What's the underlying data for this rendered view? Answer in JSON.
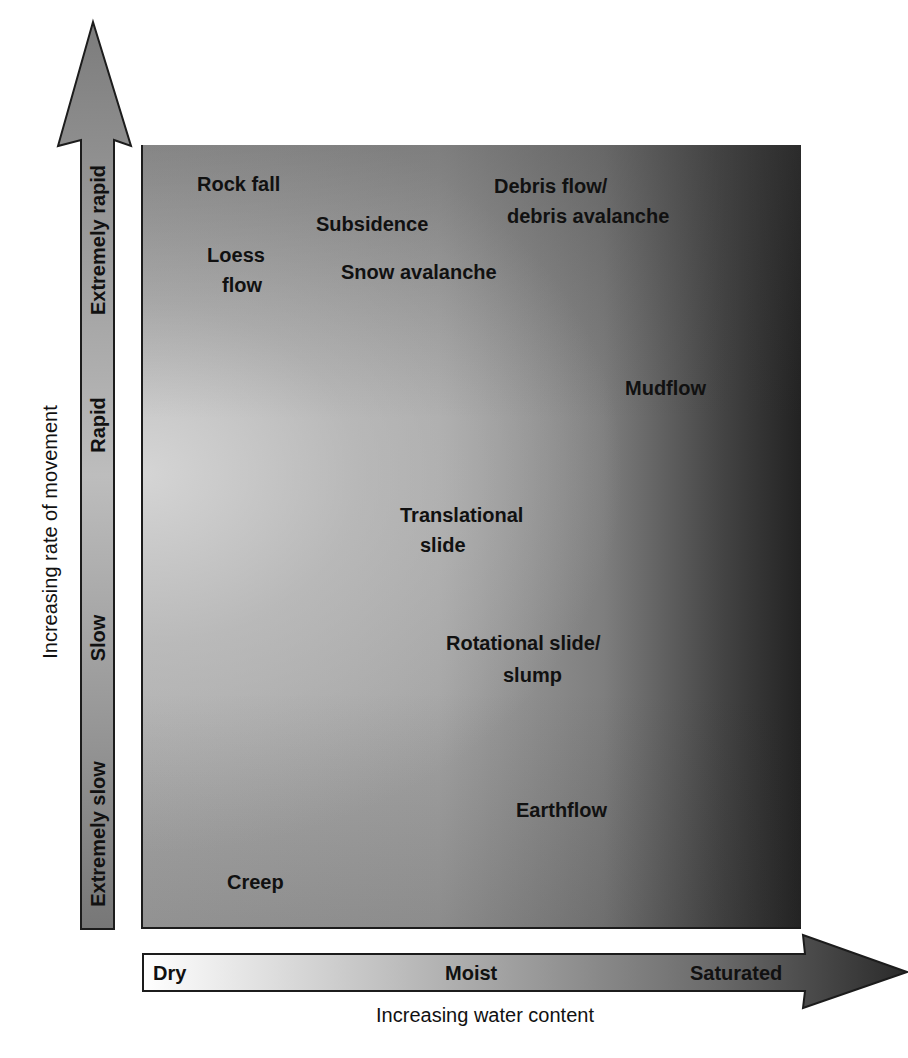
{
  "diagram": {
    "y_axis": {
      "title": "Increasing rate of movement",
      "bands": [
        "Extremely rapid",
        "Rapid",
        "Slow",
        "Extremely slow"
      ]
    },
    "x_axis": {
      "title": "Increasing water content",
      "bands": [
        "Dry",
        "Moist",
        "Saturated"
      ]
    },
    "movements": [
      {
        "lines": [
          "Rock fall"
        ]
      },
      {
        "lines": [
          "Loess",
          "flow"
        ]
      },
      {
        "lines": [
          "Subsidence"
        ]
      },
      {
        "lines": [
          "Snow avalanche"
        ]
      },
      {
        "lines": [
          "Debris flow/",
          "debris avalanche"
        ]
      },
      {
        "lines": [
          "Mudflow"
        ]
      },
      {
        "lines": [
          "Translational",
          "slide"
        ]
      },
      {
        "lines": [
          "Rotational slide/",
          "slump"
        ]
      },
      {
        "lines": [
          "Earthflow"
        ]
      },
      {
        "lines": [
          "Creep"
        ]
      }
    ]
  },
  "colors": {
    "field_light": "#d2d2d2",
    "field_mid": "#a4a4a4",
    "field_dark": "#222222",
    "outline": "#1c1c1c",
    "text": "#111111"
  }
}
